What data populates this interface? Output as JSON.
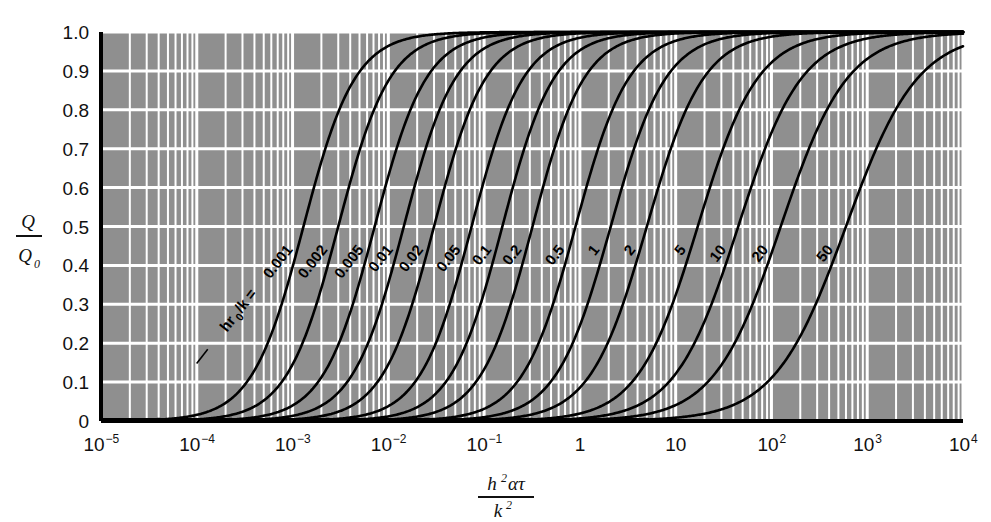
{
  "chart_data": {
    "type": "line",
    "title": "",
    "xlabel": "h²ατ / k²",
    "ylabel": "Q/Q₀",
    "xscale": "log",
    "yscale": "linear",
    "xlim": [
      1e-05,
      10000.0
    ],
    "ylim": [
      0,
      1.0
    ],
    "grid": true,
    "legend": "inline-curve-labels",
    "background_color": "#8f8f8f",
    "gridline_color": "#ffffff",
    "curve_color": "#000000",
    "x_tick_labels": [
      "10⁻⁵",
      "10⁻⁴",
      "10⁻³",
      "10⁻²",
      "10⁻¹",
      "1",
      "10",
      "10²",
      "10³",
      "10⁴"
    ],
    "x_tick_values": [
      1e-05,
      0.0001,
      0.001,
      0.01,
      0.1,
      1,
      10,
      100,
      1000,
      10000
    ],
    "y_tick_labels": [
      "0",
      "0.1",
      "0.2",
      "0.3",
      "0.4",
      "0.5",
      "0.6",
      "0.7",
      "0.8",
      "0.9",
      "1.0"
    ],
    "y_tick_values": [
      0,
      0.1,
      0.2,
      0.3,
      0.4,
      0.5,
      0.6,
      0.7,
      0.8,
      0.9,
      1.0
    ],
    "parameter_name": "hr₀/k",
    "first_label_prefix": "hr₀/k = ",
    "series": [
      {
        "name": "0.001",
        "value": 0.001,
        "x50": 0.0013,
        "spread": 0.62,
        "label": "0.001"
      },
      {
        "name": "0.002",
        "value": 0.002,
        "x50": 0.003,
        "spread": 0.62,
        "label": "0.002"
      },
      {
        "name": "0.005",
        "value": 0.005,
        "x50": 0.0072,
        "spread": 0.62,
        "label": "0.005"
      },
      {
        "name": "0.01",
        "value": 0.01,
        "x50": 0.0145,
        "spread": 0.62,
        "label": "0.01"
      },
      {
        "name": "0.02",
        "value": 0.02,
        "x50": 0.03,
        "spread": 0.62,
        "label": "0.02"
      },
      {
        "name": "0.05",
        "value": 0.05,
        "x50": 0.074,
        "spread": 0.62,
        "label": "0.05"
      },
      {
        "name": "0.1",
        "value": 0.1,
        "x50": 0.155,
        "spread": 0.62,
        "label": "0.1"
      },
      {
        "name": "0.2",
        "value": 0.2,
        "x50": 0.32,
        "spread": 0.62,
        "label": "0.2"
      },
      {
        "name": "0.5",
        "value": 0.5,
        "x50": 0.9,
        "spread": 0.64,
        "label": "0.5"
      },
      {
        "name": "1",
        "value": 1,
        "x50": 2.1,
        "spread": 0.66,
        "label": "1"
      },
      {
        "name": "2",
        "value": 2,
        "x50": 5.0,
        "spread": 0.68,
        "label": "2"
      },
      {
        "name": "5",
        "value": 5,
        "x50": 17.0,
        "spread": 0.72,
        "label": "5"
      },
      {
        "name": "10",
        "value": 10,
        "x50": 45.0,
        "spread": 0.76,
        "label": "10"
      },
      {
        "name": "20",
        "value": 20,
        "x50": 125.0,
        "spread": 0.8,
        "label": "20"
      },
      {
        "name": "50",
        "value": 50,
        "x50": 600.0,
        "spread": 0.86,
        "label": "50"
      }
    ]
  },
  "axes": {
    "y_axis_numerator": "Q",
    "y_axis_denominator": "Q",
    "y_axis_denominator_sub": "0",
    "x_axis_numerator_h": "h",
    "x_axis_numerator_h_sup": "2",
    "x_axis_numerator_alpha": "ατ",
    "x_axis_denominator_k": "k",
    "x_axis_denominator_k_sup": "2"
  }
}
